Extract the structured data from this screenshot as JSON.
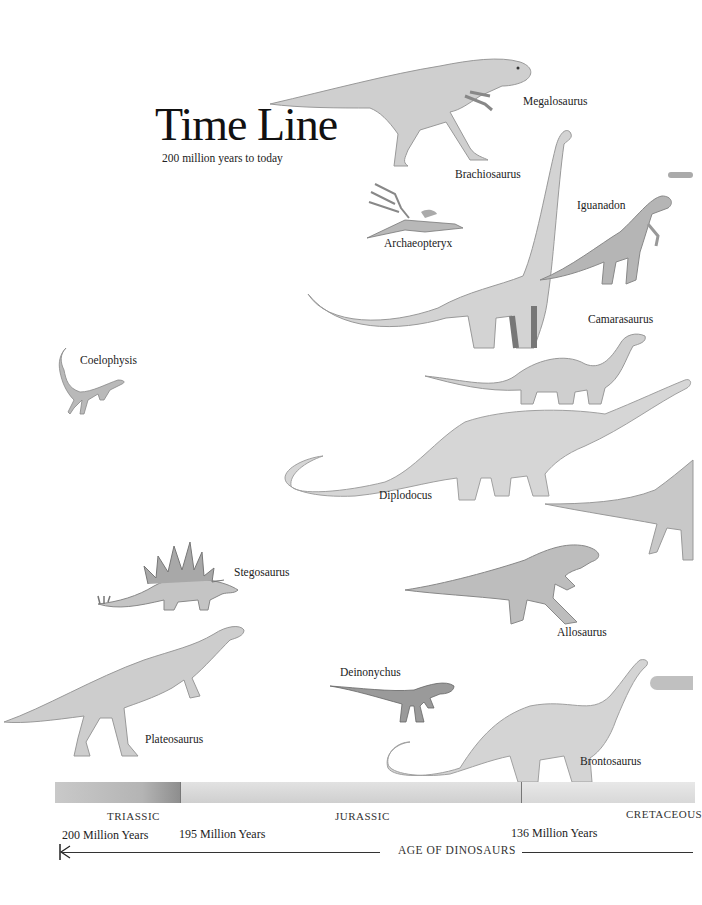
{
  "header": {
    "title": "Time Line",
    "subtitle": "200 million years to today"
  },
  "dinosaurs": [
    {
      "name": "Megalosaurus"
    },
    {
      "name": "Brachiosaurus"
    },
    {
      "name": "Iguanadon"
    },
    {
      "name": "Archaeopteryx"
    },
    {
      "name": "Camarasaurus"
    },
    {
      "name": "Coelophysis"
    },
    {
      "name": "Diplodocus"
    },
    {
      "name": "Stegosaurus"
    },
    {
      "name": "Allosaurus"
    },
    {
      "name": "Deinonychus"
    },
    {
      "name": "Plateosaurus"
    },
    {
      "name": "Brontosaurus"
    }
  ],
  "timeline": {
    "periods": [
      "TRIASSIC",
      "JURASSIC",
      "CRETACEOUS"
    ],
    "markers": [
      "200 Million Years",
      "195 Million Years",
      "136 Million Years"
    ],
    "axis_label": "AGE OF DINOSAURS"
  },
  "colors": {
    "background": "#ffffff",
    "ink": "#1a1a1a",
    "sketch_light": "#d6d6d6",
    "sketch_mid": "#a8a8a8",
    "sketch_dark": "#6e6e6e"
  }
}
